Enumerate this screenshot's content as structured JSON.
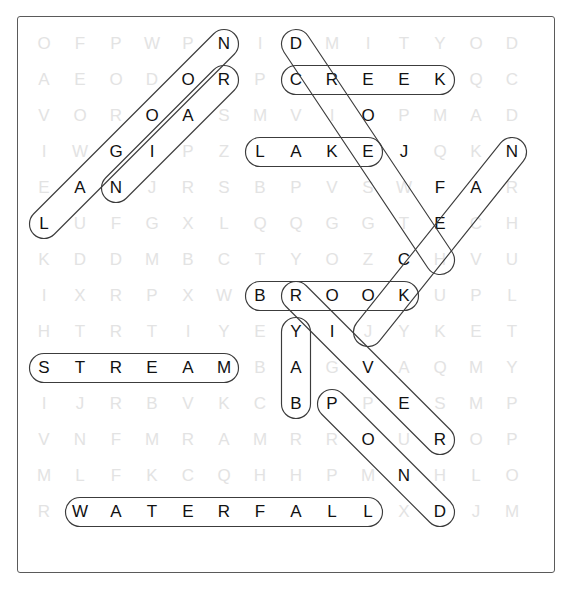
{
  "puzzle": {
    "type": "word-search",
    "theme": "bodies of water",
    "rows": 14,
    "cols": 14,
    "cell_size": 36,
    "origin": {
      "x": 26,
      "y": 26
    },
    "colors": {
      "letter_unfound": "#e3e3e3",
      "letter_found": "#111111",
      "loop_stroke": "#3c3c3c",
      "frame": "#5a5a5a",
      "background": "#ffffff"
    },
    "grid": [
      [
        "O",
        "F",
        "P",
        "W",
        "P",
        "N",
        "I",
        "D",
        "M",
        "I",
        "T",
        "Y",
        "O",
        "D"
      ],
      [
        "A",
        "E",
        "O",
        "D",
        "O",
        "R",
        "P",
        "C",
        "R",
        "E",
        "E",
        "K",
        "Q",
        "C"
      ],
      [
        "V",
        "O",
        "R",
        "O",
        "A",
        "S",
        "M",
        "V",
        "I",
        "O",
        "P",
        "M",
        "A",
        "D"
      ],
      [
        "I",
        "W",
        "G",
        "I",
        "P",
        "Z",
        "L",
        "A",
        "K",
        "E",
        "J",
        "Q",
        "K",
        "N"
      ],
      [
        "E",
        "A",
        "N",
        "J",
        "R",
        "S",
        "B",
        "P",
        "V",
        "S",
        "W",
        "F",
        "A",
        "R"
      ],
      [
        "L",
        "U",
        "F",
        "G",
        "X",
        "L",
        "Q",
        "Q",
        "G",
        "G",
        "T",
        "E",
        "C",
        "H"
      ],
      [
        "K",
        "D",
        "D",
        "M",
        "B",
        "C",
        "T",
        "Y",
        "O",
        "Z",
        "C",
        "H",
        "V",
        "U"
      ],
      [
        "I",
        "X",
        "R",
        "P",
        "X",
        "W",
        "B",
        "R",
        "O",
        "O",
        "K",
        "U",
        "P",
        "L"
      ],
      [
        "H",
        "T",
        "R",
        "T",
        "I",
        "Y",
        "E",
        "Y",
        "I",
        "J",
        "Y",
        "K",
        "E",
        "T"
      ],
      [
        "S",
        "T",
        "R",
        "E",
        "A",
        "M",
        "B",
        "A",
        "G",
        "V",
        "A",
        "Q",
        "M",
        "Y"
      ],
      [
        "I",
        "J",
        "R",
        "B",
        "V",
        "K",
        "C",
        "B",
        "P",
        "P",
        "E",
        "S",
        "M",
        "P"
      ],
      [
        "V",
        "N",
        "F",
        "M",
        "R",
        "A",
        "M",
        "R",
        "R",
        "O",
        "U",
        "R",
        "O",
        "P"
      ],
      [
        "M",
        "L",
        "F",
        "K",
        "C",
        "Q",
        "H",
        "H",
        "P",
        "M",
        "N",
        "H",
        "L",
        "O"
      ],
      [
        "R",
        "W",
        "A",
        "T",
        "E",
        "R",
        "F",
        "A",
        "L",
        "L",
        "X",
        "D",
        "J",
        "M"
      ]
    ],
    "found_words": [
      {
        "word": "LAGOON",
        "letters": [
          "L",
          "A",
          "G",
          "I",
          "O",
          "N"
        ],
        "direction": "diagonal-up-right",
        "start": {
          "row": 5,
          "col": 0
        },
        "end": {
          "row": 0,
          "col": 5
        },
        "cells": [
          {
            "row": 5,
            "col": 0,
            "letter": "L"
          },
          {
            "row": 4,
            "col": 1,
            "letter": "A"
          },
          {
            "row": 3,
            "col": 2,
            "letter": "G"
          },
          {
            "row": 2,
            "col": 3,
            "letter": "O"
          },
          {
            "row": 1,
            "col": 4,
            "letter": "O"
          },
          {
            "row": 0,
            "col": 5,
            "letter": "N"
          }
        ]
      },
      {
        "word": "NIAGARA",
        "letters": [
          "N",
          "I",
          "A",
          "O",
          "R"
        ],
        "direction": "diagonal-up-right",
        "start": {
          "row": 4,
          "col": 2
        },
        "end": {
          "row": 1,
          "col": 5
        },
        "cells": [
          {
            "row": 4,
            "col": 2,
            "letter": "N"
          },
          {
            "row": 3,
            "col": 3,
            "letter": "I"
          },
          {
            "row": 2,
            "col": 4,
            "letter": "A"
          },
          {
            "row": 1,
            "col": 5,
            "letter": "R"
          }
        ]
      },
      {
        "word": "CREEK",
        "letters": [
          "C",
          "R",
          "E",
          "E",
          "K"
        ],
        "direction": "horizontal",
        "start": {
          "row": 1,
          "col": 7
        },
        "end": {
          "row": 1,
          "col": 11
        },
        "cells": [
          {
            "row": 1,
            "col": 7,
            "letter": "C"
          },
          {
            "row": 1,
            "col": 8,
            "letter": "R"
          },
          {
            "row": 1,
            "col": 9,
            "letter": "E"
          },
          {
            "row": 1,
            "col": 10,
            "letter": "E"
          },
          {
            "row": 1,
            "col": 11,
            "letter": "K"
          }
        ]
      },
      {
        "word": "LAKE",
        "letters": [
          "L",
          "A",
          "K",
          "E"
        ],
        "direction": "horizontal",
        "start": {
          "row": 3,
          "col": 6
        },
        "end": {
          "row": 3,
          "col": 9
        },
        "cells": [
          {
            "row": 3,
            "col": 6,
            "letter": "L"
          },
          {
            "row": 3,
            "col": 7,
            "letter": "A"
          },
          {
            "row": 3,
            "col": 8,
            "letter": "K"
          },
          {
            "row": 3,
            "col": 9,
            "letter": "E"
          }
        ]
      },
      {
        "word": "DIVIDE",
        "letters": [
          "D",
          "O",
          "E",
          "C",
          "O"
        ],
        "direction": "diagonal-down-right",
        "start": {
          "row": 0,
          "col": 7
        },
        "end": {
          "row": 7,
          "col": 10
        },
        "cells": [
          {
            "row": 0,
            "col": 7,
            "letter": "D"
          },
          {
            "row": 2,
            "col": 9,
            "letter": "O"
          },
          {
            "row": 5,
            "col": 11,
            "letter": "F"
          },
          {
            "row": 6,
            "col": 11,
            "letter": "E"
          },
          {
            "row": 7,
            "col": 10,
            "letter": "C"
          },
          {
            "row": 8,
            "col": 10,
            "letter": "K"
          }
        ]
      },
      {
        "word": "FJORD",
        "letters": [
          "F",
          "E",
          "C",
          "K"
        ],
        "direction": "diagonal-down-left",
        "start": {
          "row": 3,
          "col": 13
        },
        "end": {
          "row": 8,
          "col": 9
        },
        "cells": [
          {
            "row": 3,
            "col": 13,
            "letter": "N"
          },
          {
            "row": 4,
            "col": 12,
            "letter": "A"
          },
          {
            "row": 5,
            "col": 11,
            "letter": "E"
          },
          {
            "row": 7,
            "col": 10,
            "letter": "C"
          },
          {
            "row": 8,
            "col": 9,
            "letter": "O"
          }
        ]
      },
      {
        "word": "BROOK",
        "letters": [
          "B",
          "R",
          "O",
          "O",
          "K"
        ],
        "direction": "horizontal",
        "start": {
          "row": 7,
          "col": 6
        },
        "end": {
          "row": 7,
          "col": 10
        },
        "cells": [
          {
            "row": 7,
            "col": 6,
            "letter": "B"
          },
          {
            "row": 7,
            "col": 7,
            "letter": "R"
          },
          {
            "row": 7,
            "col": 8,
            "letter": "O"
          },
          {
            "row": 7,
            "col": 9,
            "letter": "O"
          },
          {
            "row": 7,
            "col": 10,
            "letter": "K"
          }
        ]
      },
      {
        "word": "BAY",
        "letters": [
          "Y",
          "A",
          "B"
        ],
        "direction": "vertical-down",
        "start": {
          "row": 8,
          "col": 7
        },
        "end": {
          "row": 10,
          "col": 7
        },
        "cells": [
          {
            "row": 8,
            "col": 7,
            "letter": "Y"
          },
          {
            "row": 9,
            "col": 7,
            "letter": "A"
          },
          {
            "row": 10,
            "col": 7,
            "letter": "B"
          }
        ]
      },
      {
        "word": "RIVER",
        "letters": [
          "R",
          "I",
          "V",
          "E",
          "R"
        ],
        "direction": "diagonal-down-right",
        "start": {
          "row": 7,
          "col": 7
        },
        "end": {
          "row": 11,
          "col": 11
        },
        "cells": [
          {
            "row": 7,
            "col": 7,
            "letter": "R"
          },
          {
            "row": 8,
            "col": 8,
            "letter": "I"
          },
          {
            "row": 9,
            "col": 9,
            "letter": "V"
          },
          {
            "row": 10,
            "col": 10,
            "letter": "E"
          },
          {
            "row": 11,
            "col": 11,
            "letter": "R"
          }
        ]
      },
      {
        "word": "STREAM",
        "letters": [
          "S",
          "T",
          "R",
          "E",
          "A",
          "M"
        ],
        "direction": "horizontal",
        "start": {
          "row": 9,
          "col": 0
        },
        "end": {
          "row": 9,
          "col": 5
        },
        "cells": [
          {
            "row": 9,
            "col": 0,
            "letter": "S"
          },
          {
            "row": 9,
            "col": 1,
            "letter": "T"
          },
          {
            "row": 9,
            "col": 2,
            "letter": "R"
          },
          {
            "row": 9,
            "col": 3,
            "letter": "E"
          },
          {
            "row": 9,
            "col": 4,
            "letter": "A"
          },
          {
            "row": 9,
            "col": 5,
            "letter": "M"
          }
        ]
      },
      {
        "word": "POND",
        "letters": [
          "P",
          "O",
          "N",
          "D"
        ],
        "direction": "diagonal-down-right",
        "start": {
          "row": 10,
          "col": 8
        },
        "end": {
          "row": 13,
          "col": 11
        },
        "cells": [
          {
            "row": 10,
            "col": 8,
            "letter": "P"
          },
          {
            "row": 11,
            "col": 9,
            "letter": "O"
          },
          {
            "row": 12,
            "col": 10,
            "letter": "N"
          },
          {
            "row": 13,
            "col": 11,
            "letter": "D"
          }
        ]
      },
      {
        "word": "WATERFALL",
        "letters": [
          "W",
          "A",
          "T",
          "E",
          "R",
          "F",
          "A",
          "L",
          "L"
        ],
        "direction": "horizontal",
        "start": {
          "row": 13,
          "col": 1
        },
        "end": {
          "row": 13,
          "col": 9
        },
        "cells": [
          {
            "row": 13,
            "col": 1,
            "letter": "W"
          },
          {
            "row": 13,
            "col": 2,
            "letter": "A"
          },
          {
            "row": 13,
            "col": 3,
            "letter": "T"
          },
          {
            "row": 13,
            "col": 4,
            "letter": "E"
          },
          {
            "row": 13,
            "col": 5,
            "letter": "R"
          },
          {
            "row": 13,
            "col": 6,
            "letter": "F"
          },
          {
            "row": 13,
            "col": 7,
            "letter": "A"
          },
          {
            "row": 13,
            "col": 8,
            "letter": "L"
          },
          {
            "row": 13,
            "col": 9,
            "letter": "L"
          }
        ]
      }
    ],
    "highlighted_cells": [
      {
        "row": 0,
        "col": 5
      },
      {
        "row": 0,
        "col": 7
      },
      {
        "row": 1,
        "col": 4
      },
      {
        "row": 1,
        "col": 5
      },
      {
        "row": 1,
        "col": 7
      },
      {
        "row": 1,
        "col": 8
      },
      {
        "row": 1,
        "col": 9
      },
      {
        "row": 1,
        "col": 10
      },
      {
        "row": 1,
        "col": 11
      },
      {
        "row": 2,
        "col": 3
      },
      {
        "row": 2,
        "col": 4
      },
      {
        "row": 2,
        "col": 9
      },
      {
        "row": 3,
        "col": 2
      },
      {
        "row": 3,
        "col": 3
      },
      {
        "row": 3,
        "col": 6
      },
      {
        "row": 3,
        "col": 7
      },
      {
        "row": 3,
        "col": 8
      },
      {
        "row": 3,
        "col": 9
      },
      {
        "row": 3,
        "col": 10
      },
      {
        "row": 3,
        "col": 13
      },
      {
        "row": 4,
        "col": 1
      },
      {
        "row": 4,
        "col": 2
      },
      {
        "row": 4,
        "col": 11
      },
      {
        "row": 4,
        "col": 12
      },
      {
        "row": 5,
        "col": 0
      },
      {
        "row": 5,
        "col": 11
      },
      {
        "row": 6,
        "col": 10
      },
      {
        "row": 7,
        "col": 6
      },
      {
        "row": 7,
        "col": 7
      },
      {
        "row": 7,
        "col": 8
      },
      {
        "row": 7,
        "col": 9
      },
      {
        "row": 7,
        "col": 10
      },
      {
        "row": 8,
        "col": 7
      },
      {
        "row": 8,
        "col": 8
      },
      {
        "row": 9,
        "col": 0
      },
      {
        "row": 9,
        "col": 1
      },
      {
        "row": 9,
        "col": 2
      },
      {
        "row": 9,
        "col": 3
      },
      {
        "row": 9,
        "col": 4
      },
      {
        "row": 9,
        "col": 5
      },
      {
        "row": 9,
        "col": 7
      },
      {
        "row": 9,
        "col": 9
      },
      {
        "row": 10,
        "col": 7
      },
      {
        "row": 10,
        "col": 8
      },
      {
        "row": 10,
        "col": 10
      },
      {
        "row": 11,
        "col": 9
      },
      {
        "row": 11,
        "col": 11
      },
      {
        "row": 12,
        "col": 10
      },
      {
        "row": 13,
        "col": 1
      },
      {
        "row": 13,
        "col": 2
      },
      {
        "row": 13,
        "col": 3
      },
      {
        "row": 13,
        "col": 4
      },
      {
        "row": 13,
        "col": 5
      },
      {
        "row": 13,
        "col": 6
      },
      {
        "row": 13,
        "col": 7
      },
      {
        "row": 13,
        "col": 8
      },
      {
        "row": 13,
        "col": 9
      },
      {
        "row": 13,
        "col": 11
      }
    ],
    "loops": [
      {
        "name": "loop-lagoon",
        "r1": 5,
        "c1": 0,
        "r2": 0,
        "c2": 5
      },
      {
        "name": "loop-rapids",
        "r1": 4,
        "c1": 2,
        "r2": 1,
        "c2": 5
      },
      {
        "name": "loop-creek",
        "r1": 1,
        "c1": 7,
        "r2": 1,
        "c2": 11
      },
      {
        "name": "loop-delta",
        "r1": 0,
        "c1": 7,
        "r2": 6,
        "c2": 11
      },
      {
        "name": "loop-lake",
        "r1": 3,
        "c1": 6,
        "r2": 3,
        "c2": 9
      },
      {
        "name": "loop-fjord",
        "r1": 3,
        "c1": 13,
        "r2": 8,
        "c2": 9
      },
      {
        "name": "loop-brook",
        "r1": 7,
        "c1": 6,
        "r2": 7,
        "c2": 10
      },
      {
        "name": "loop-bay",
        "r1": 8,
        "c1": 7,
        "r2": 10,
        "c2": 7
      },
      {
        "name": "loop-river",
        "r1": 7,
        "c1": 7,
        "r2": 11,
        "c2": 11
      },
      {
        "name": "loop-stream",
        "r1": 9,
        "c1": 0,
        "r2": 9,
        "c2": 5
      },
      {
        "name": "loop-pond",
        "r1": 10,
        "c1": 8,
        "r2": 13,
        "c2": 11
      },
      {
        "name": "loop-waterfall",
        "r1": 13,
        "c1": 1,
        "r2": 13,
        "c2": 9
      }
    ]
  }
}
